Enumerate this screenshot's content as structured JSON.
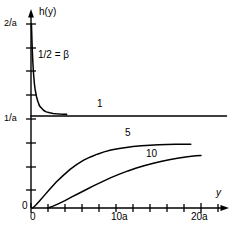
{
  "chart_data": {
    "type": "line",
    "title": "",
    "subtitle": "",
    "xlabel": "y",
    "ylabel": "h(y)",
    "xlim": [
      0,
      23
    ],
    "ylim": [
      0,
      2
    ],
    "grid": false,
    "legend_position": "inline-curve-labels",
    "x_ticks": [
      {
        "value": 0,
        "label": "0"
      },
      {
        "value": 2,
        "label": ""
      },
      {
        "value": 4,
        "label": ""
      },
      {
        "value": 6,
        "label": ""
      },
      {
        "value": 8,
        "label": ""
      },
      {
        "value": 10,
        "label": "10a"
      },
      {
        "value": 12,
        "label": ""
      },
      {
        "value": 14,
        "label": ""
      },
      {
        "value": 16,
        "label": ""
      },
      {
        "value": 18,
        "label": ""
      },
      {
        "value": 20,
        "label": "20a"
      },
      {
        "value": 22,
        "label": ""
      }
    ],
    "y_ticks": [
      {
        "value": 0.0,
        "label": "0"
      },
      {
        "value": 0.25,
        "label": ""
      },
      {
        "value": 0.5,
        "label": ""
      },
      {
        "value": 0.75,
        "label": ""
      },
      {
        "value": 1.0,
        "label": "1/a"
      },
      {
        "value": 1.25,
        "label": ""
      },
      {
        "value": 1.5,
        "label": ""
      },
      {
        "value": 1.75,
        "label": ""
      },
      {
        "value": 2.0,
        "label": "2/a"
      }
    ],
    "annotations": [
      {
        "name": "beta-value",
        "text": "1/2 = β",
        "x": 1.2,
        "y": 1.62
      }
    ],
    "series": [
      {
        "name": "beta = 1/2",
        "label": "",
        "color": "#000000",
        "x": [
          0.05,
          0.08,
          0.12,
          0.16,
          0.2,
          0.25,
          0.3,
          0.4,
          0.5,
          0.65,
          0.8,
          1.0,
          1.2,
          1.5,
          1.8,
          2.2,
          2.6,
          3.0,
          3.4,
          3.8,
          4.2
        ],
        "y": [
          2.0,
          1.92,
          1.8,
          1.7,
          1.62,
          1.53,
          1.46,
          1.35,
          1.28,
          1.21,
          1.16,
          1.11,
          1.09,
          1.06,
          1.045,
          1.035,
          1.028,
          1.024,
          1.021,
          1.019,
          1.018
        ]
      },
      {
        "name": "beta = 1",
        "label": "1",
        "color": "#000000",
        "x": [
          0.0,
          23.0
        ],
        "y": [
          1.0,
          1.0
        ]
      },
      {
        "name": "beta = 5",
        "label": "5",
        "color": "#000000",
        "x": [
          0.2,
          0.6,
          1.0,
          1.6,
          2.2,
          3.0,
          3.8,
          4.6,
          5.4,
          6.2,
          7.0,
          7.8,
          8.6,
          9.4,
          10.2,
          11.0,
          12.0,
          13.0,
          14.0,
          15.0,
          16.0,
          17.0,
          18.0,
          18.8
        ],
        "y": [
          0.0,
          0.035,
          0.075,
          0.14,
          0.205,
          0.285,
          0.355,
          0.42,
          0.475,
          0.52,
          0.555,
          0.585,
          0.61,
          0.63,
          0.645,
          0.655,
          0.668,
          0.676,
          0.682,
          0.687,
          0.69,
          0.692,
          0.693,
          0.694
        ]
      },
      {
        "name": "beta = 10",
        "label": "10",
        "color": "#000000",
        "x": [
          2.0,
          2.6,
          3.2,
          4.0,
          4.8,
          5.6,
          6.4,
          7.4,
          8.4,
          9.4,
          10.4,
          11.4,
          12.4,
          13.4,
          14.4,
          15.4,
          16.4,
          17.4,
          18.4,
          19.4,
          20.0
        ],
        "y": [
          0.0,
          0.02,
          0.045,
          0.08,
          0.12,
          0.158,
          0.196,
          0.243,
          0.287,
          0.33,
          0.368,
          0.403,
          0.434,
          0.462,
          0.487,
          0.508,
          0.527,
          0.543,
          0.556,
          0.567,
          0.572
        ]
      }
    ]
  },
  "labels": {
    "y_axis_title": "h(y)",
    "x_axis_title": "y",
    "y_tick_2a_num": "2",
    "y_tick_2a_slash": "/",
    "y_tick_2a_den": "a",
    "y_tick_1a_num": "1",
    "y_tick_1a_slash": "/",
    "y_tick_1a_den": "a",
    "x_tick_zero": "0",
    "y_tick_zero": "0",
    "x_tick_10a": "10a",
    "x_tick_20a": "20a",
    "annotation_beta": "1/2 = β",
    "curve_label_1": "1",
    "curve_label_5": "5",
    "curve_label_10": "10"
  },
  "colors": {
    "axis": "#000000",
    "curve": "#000000",
    "background": "#ffffff"
  }
}
